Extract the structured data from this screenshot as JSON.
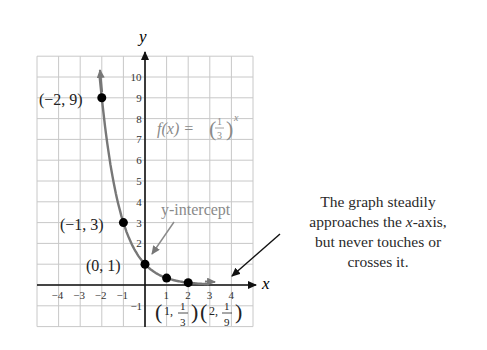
{
  "chart_data": {
    "type": "line",
    "title": "",
    "function_label": "f(x) = (1/3)^x",
    "xlabel": "x",
    "ylabel": "y",
    "xlim": [
      -5,
      5
    ],
    "ylim": [
      -2,
      11
    ],
    "grid": true,
    "x_ticks": [
      -4,
      -3,
      -2,
      -1,
      1,
      2,
      3,
      4
    ],
    "y_ticks": [
      -1,
      2,
      3,
      4,
      5,
      6,
      7,
      8,
      9,
      10
    ],
    "points": [
      {
        "x": -2,
        "y": 9,
        "label": "(−2, 9)"
      },
      {
        "x": -1,
        "y": 3,
        "label": "(−1, 3)"
      },
      {
        "x": 0,
        "y": 1,
        "label": "(0, 1)"
      },
      {
        "x": 1,
        "y": 0.3333,
        "label": "(1, 1/3)"
      },
      {
        "x": 2,
        "y": 0.1111,
        "label": "(2, 1/9)"
      }
    ],
    "annotations": [
      {
        "text": "y-intercept",
        "points_to": [
          0,
          1
        ]
      },
      {
        "text": "The graph steadily approaches the x-axis, but never touches or crosses it.",
        "points_to": [
          3.8,
          0.1
        ]
      }
    ]
  },
  "labels": {
    "x_axis": "x",
    "y_axis": "y",
    "func_prefix": "f(x) = ",
    "intercept": "y-intercept",
    "p1": "(−2, 9)",
    "p2": "(−1, 3)",
    "p3": "(0, 1)",
    "note_line1": "The graph steadily",
    "note_line2a": "approaches the ",
    "note_line2b": "x",
    "note_line2c": "-axis,",
    "note_line3": "but never touches or",
    "note_line4": "crosses it."
  }
}
